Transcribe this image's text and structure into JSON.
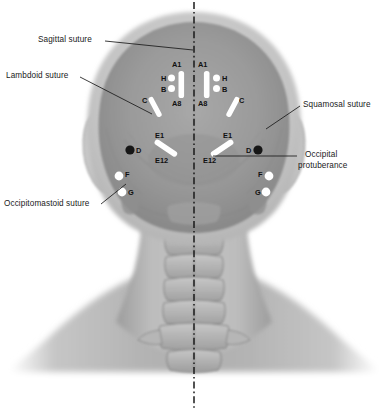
{
  "figure": {
    "view": "posterior",
    "modality": "grayscale anatomical illustration",
    "midline": {
      "style": "dash-dot",
      "color": "#1a1a1a"
    }
  },
  "annotations": [
    {
      "id": "sagittal-suture",
      "text": "Sagittal suture",
      "side": "left"
    },
    {
      "id": "lambdoid-suture",
      "text": "Lambdoid suture",
      "side": "left"
    },
    {
      "id": "occipitomastoid-suture",
      "text": "Occipitomastoid suture",
      "side": "left"
    },
    {
      "id": "squamosal-suture",
      "text": "Squamosal suture",
      "side": "right"
    },
    {
      "id": "occipital-protuberance",
      "text": "Occipital",
      "text2": "protuberance",
      "side": "right"
    }
  ],
  "markers": {
    "left": {
      "a1": "A1",
      "a8": "A8",
      "h": "H",
      "b": "B",
      "c": "C",
      "e1": "E1",
      "e12": "E12",
      "d": "D",
      "f": "F",
      "g": "G"
    },
    "right": {
      "a1": "A1",
      "a8": "A8",
      "h": "H",
      "b": "B",
      "c": "C",
      "e1": "E1",
      "e12": "E12",
      "d": "D",
      "f": "F",
      "g": "G"
    }
  },
  "colors": {
    "electrode_light": "#ffffff",
    "electrode_dark": "#161616",
    "skull": "#9a9a9a",
    "scalp": "#c9c9c9",
    "neck": "#b3b3b3",
    "leader_line": "#1a1a1a",
    "background": "#ffffff"
  }
}
